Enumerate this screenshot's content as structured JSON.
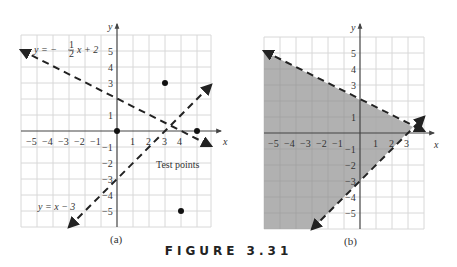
{
  "figure_label": "FIGURE 3.31",
  "panels": [
    {
      "caption": "(a)",
      "x_axis_label": "x",
      "y_axis_label": "y",
      "x_ticks": [
        "−5",
        "−4",
        "−3",
        "−2",
        "−1",
        "1",
        "2",
        "3",
        "4"
      ],
      "y_ticks_pos": [
        "1",
        "3",
        "4",
        "5"
      ],
      "y_ticks_neg": [
        "−1",
        "−2",
        "−3",
        "−4",
        "−5"
      ],
      "line1_label": "y = −",
      "line1_frac_num": "1",
      "line1_frac_den": "2",
      "line1_label_tail": "x + 2",
      "line2_label": "y = x − 3",
      "test_points_label": "Test points",
      "test_points": [
        [
          0,
          0
        ],
        [
          3,
          3
        ],
        [
          5,
          0
        ],
        [
          4,
          -5
        ]
      ]
    },
    {
      "caption": "(b)",
      "x_axis_label": "x",
      "y_axis_label": "y",
      "x_ticks": [
        "−5",
        "−4",
        "−3",
        "−2",
        "−1",
        "1",
        "2",
        "3"
      ],
      "y_ticks_pos": [
        "1",
        "3",
        "4",
        "5"
      ],
      "y_ticks_neg": [
        "−1",
        "−2",
        "−3",
        "−4",
        "−5"
      ],
      "shaded_region": "y < −(1/2)x + 2 and y > x − 3"
    }
  ],
  "colors": {
    "grid": "#d8d8d8",
    "axis": "#444444",
    "line": "#222222",
    "shade": "#a9a9a9"
  }
}
